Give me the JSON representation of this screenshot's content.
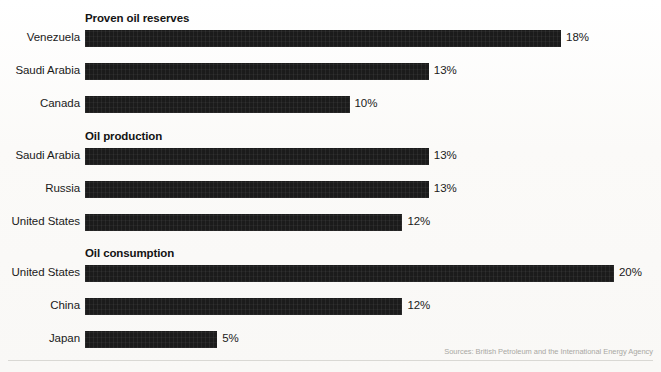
{
  "chart_data": {
    "type": "bar",
    "orientation": "horizontal",
    "title": "",
    "xlabel": "",
    "ylabel": "",
    "xlim": [
      0,
      20
    ],
    "grid": false,
    "legend": null,
    "value_suffix": "%",
    "groups": [
      {
        "title": "Proven oil reserves",
        "categories": [
          "Venezuela",
          "Saudi Arabia",
          "Canada"
        ],
        "values": [
          18,
          13,
          10
        ],
        "labels": [
          "18%",
          "13%",
          "10%"
        ]
      },
      {
        "title": "Oil production",
        "categories": [
          "Saudi Arabia",
          "Russia",
          "United States"
        ],
        "values": [
          13,
          13,
          12
        ],
        "labels": [
          "13%",
          "13%",
          "12%"
        ]
      },
      {
        "title": "Oil consumption",
        "categories": [
          "United States",
          "China",
          "Japan"
        ],
        "values": [
          20,
          12,
          5
        ],
        "labels": [
          "20%",
          "12%",
          "5%"
        ]
      }
    ],
    "bar_color": "#1b1b1b",
    "background_color": "#fcfcfa",
    "source": "Sources: British Petroleum and the International Energy Agency"
  },
  "footer": {
    "source": "Sources: British Petroleum and the International Energy Agency"
  }
}
